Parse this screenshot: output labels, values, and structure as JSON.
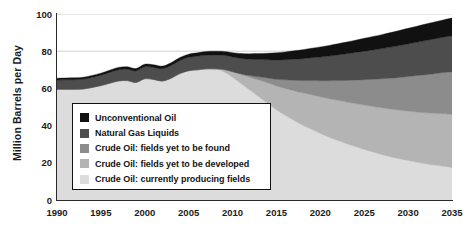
{
  "chart_data": {
    "type": "area",
    "stacked": true,
    "title": "",
    "subtitle": "",
    "xlabel": "",
    "ylabel": "Million Barrels per Day",
    "xlim": [
      1990,
      2035
    ],
    "ylim": [
      0,
      100
    ],
    "grid": "horizontal gridlines at 80 and 100",
    "legend_position": "inside lower-left",
    "x_tick_labels": [
      "1990",
      "1995",
      "2000",
      "2005",
      "2010",
      "2015",
      "2020",
      "2025",
      "2030",
      "2035"
    ],
    "y_tick_labels": [
      "0",
      "20",
      "40",
      "60",
      "80",
      "100"
    ],
    "x": [
      1990,
      1991,
      1992,
      1993,
      1994,
      1995,
      1996,
      1997,
      1998,
      1999,
      2000,
      2001,
      2002,
      2003,
      2004,
      2005,
      2006,
      2007,
      2008,
      2009,
      2010,
      2011,
      2012,
      2013,
      2014,
      2015,
      2016,
      2017,
      2018,
      2019,
      2020,
      2021,
      2022,
      2023,
      2024,
      2025,
      2026,
      2027,
      2028,
      2029,
      2030,
      2031,
      2032,
      2033,
      2034,
      2035
    ],
    "series": [
      {
        "name": "Crude Oil: currently producing fields",
        "color": "#dcdcdc",
        "values": [
          59.5,
          59.5,
          59.5,
          59.7,
          60.5,
          61.5,
          62.8,
          64.0,
          64.2,
          63.2,
          65.2,
          64.8,
          64.0,
          65.5,
          68.0,
          69.5,
          70.0,
          70.5,
          70.5,
          69.0,
          66.0,
          62.5,
          59.0,
          55.5,
          52.0,
          48.5,
          45.5,
          42.8,
          40.2,
          38.0,
          35.8,
          33.8,
          32.0,
          30.3,
          28.7,
          27.2,
          25.8,
          24.5,
          23.3,
          22.2,
          21.2,
          20.3,
          19.5,
          18.8,
          18.2,
          17.5
        ]
      },
      {
        "name": "Crude Oil: fields yet to be developed",
        "color": "#b4b4b4",
        "values": [
          0,
          0,
          0,
          0,
          0,
          0,
          0,
          0,
          0,
          0,
          0,
          0,
          0,
          0,
          0,
          0,
          0,
          0,
          0,
          1.2,
          3.0,
          5.0,
          7.0,
          9.0,
          11.0,
          12.8,
          14.5,
          16.0,
          17.4,
          18.6,
          19.7,
          20.7,
          21.6,
          22.4,
          23.2,
          23.9,
          24.5,
          25.1,
          25.6,
          26.1,
          26.6,
          27.0,
          27.4,
          27.8,
          28.2,
          28.6
        ]
      },
      {
        "name": "Crude Oil: fields yet to be found",
        "color": "#8c8c8c",
        "values": [
          0,
          0,
          0,
          0,
          0,
          0,
          0,
          0,
          0,
          0,
          0,
          0,
          0,
          0,
          0,
          0,
          0,
          0,
          0,
          0,
          0,
          0.3,
          0.9,
          1.7,
          2.6,
          3.6,
          4.6,
          5.6,
          6.6,
          7.6,
          8.6,
          9.6,
          10.6,
          11.6,
          12.6,
          13.6,
          14.6,
          15.6,
          16.6,
          17.6,
          18.6,
          19.6,
          20.5,
          21.3,
          22.1,
          22.9
        ]
      },
      {
        "name": "Natural Gas Liquids",
        "color": "#4d4d4d",
        "values": [
          5.0,
          5.1,
          5.2,
          5.3,
          5.4,
          5.6,
          5.8,
          6.0,
          6.1,
          6.2,
          6.4,
          6.5,
          6.6,
          6.8,
          7.0,
          7.2,
          7.3,
          7.4,
          7.5,
          7.6,
          7.9,
          8.3,
          8.8,
          9.3,
          9.8,
          10.3,
          10.8,
          11.3,
          11.8,
          12.3,
          12.8,
          13.3,
          13.8,
          14.3,
          14.8,
          15.3,
          15.8,
          16.2,
          16.7,
          17.1,
          17.5,
          17.9,
          18.3,
          18.7,
          19.0,
          19.3
        ]
      },
      {
        "name": "Unconventional Oil",
        "color": "#111111",
        "values": [
          1.0,
          1.0,
          1.0,
          1.0,
          1.1,
          1.1,
          1.2,
          1.3,
          1.3,
          1.3,
          1.4,
          1.4,
          1.4,
          1.5,
          1.6,
          1.7,
          1.8,
          1.9,
          2.0,
          2.1,
          2.3,
          2.6,
          2.9,
          3.2,
          3.5,
          3.9,
          4.2,
          4.5,
          4.8,
          5.1,
          5.4,
          5.7,
          6.0,
          6.3,
          6.6,
          6.9,
          7.2,
          7.5,
          7.8,
          8.1,
          8.4,
          8.6,
          8.9,
          9.1,
          9.3,
          9.5
        ]
      }
    ],
    "totals": [
      65.5,
      65.6,
      65.7,
      66.0,
      67.0,
      68.2,
      69.8,
      71.3,
      71.6,
      70.7,
      73.0,
      72.7,
      72.0,
      73.8,
      76.6,
      78.4,
      79.1,
      79.8,
      80.0,
      79.9,
      79.2,
      78.7,
      79.2,
      80.3,
      81.4,
      82.7,
      83.9,
      85.1,
      86.2,
      87.2,
      88.3,
      89.3,
      90.2,
      91.1,
      92.0,
      92.8,
      93.6,
      94.3,
      95.1,
      95.8,
      96.5,
      97.1,
      97.7,
      98.2,
      98.7,
      99.2
    ]
  },
  "axes": {
    "ylabel": "Million Barrels per Day",
    "yticks": [
      "100",
      "80",
      "60",
      "40",
      "20",
      "0"
    ],
    "xticks": [
      "1990",
      "1995",
      "2000",
      "2005",
      "2010",
      "2015",
      "2020",
      "2025",
      "2030",
      "2035"
    ]
  },
  "legend": {
    "items": [
      {
        "label": "Unconventional Oil",
        "color": "#111111"
      },
      {
        "label": "Natural Gas Liquids",
        "color": "#4d4d4d"
      },
      {
        "label": "Crude Oil: fields yet to be found",
        "color": "#8c8c8c"
      },
      {
        "label": "Crude Oil: fields yet to be developed",
        "color": "#b4b4b4"
      },
      {
        "label": "Crude Oil: currently producing fields",
        "color": "#dcdcdc"
      }
    ]
  },
  "colors": {
    "background": "#ffffff",
    "axis": "#2a2a2a",
    "gridline": "#cfcfcf",
    "text": "#1b1b1b",
    "legend_border": "#111111",
    "legend_background": "#ffffff"
  }
}
